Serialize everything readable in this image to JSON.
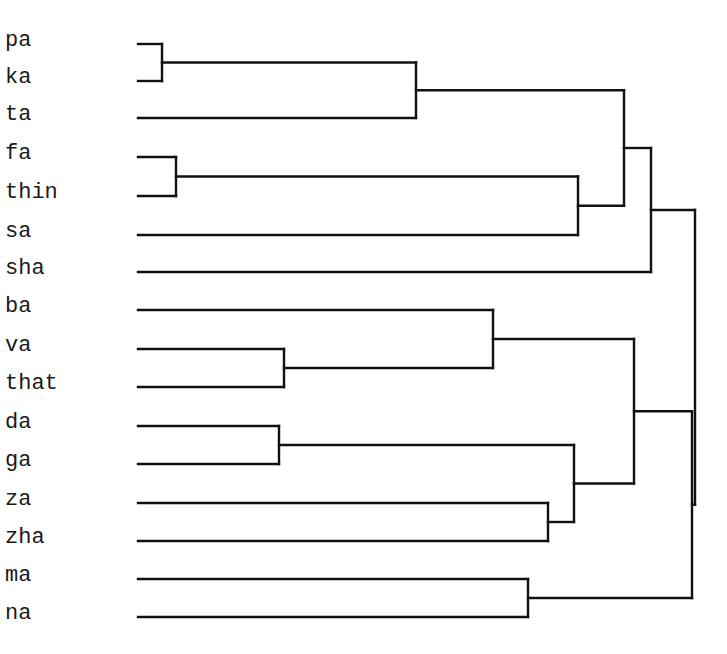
{
  "diagram": {
    "type": "dendrogram",
    "orientation": "horizontal",
    "line_color": "#111111",
    "line_width": 2.4,
    "leaf_line_start_x": 138,
    "leaves": [
      {
        "label": "pa",
        "y": 44
      },
      {
        "label": "ka",
        "y": 81
      },
      {
        "label": "ta",
        "y": 118
      },
      {
        "label": "fa",
        "y": 157
      },
      {
        "label": "thin",
        "y": 196
      },
      {
        "label": "sa",
        "y": 235
      },
      {
        "label": "sha",
        "y": 272
      },
      {
        "label": "ba",
        "y": 310
      },
      {
        "label": "va",
        "y": 349
      },
      {
        "label": "that",
        "y": 387
      },
      {
        "label": "da",
        "y": 426
      },
      {
        "label": "ga",
        "y": 464
      },
      {
        "label": "za",
        "y": 503
      },
      {
        "label": "zha",
        "y": 541
      },
      {
        "label": "ma",
        "y": 579
      },
      {
        "label": "na",
        "y": 617
      }
    ],
    "merges": [
      {
        "id": "n1",
        "children": [
          "pa",
          "ka"
        ],
        "x": 162
      },
      {
        "id": "n2",
        "children": [
          "n1",
          "ta"
        ],
        "x": 416
      },
      {
        "id": "n3",
        "children": [
          "fa",
          "thin"
        ],
        "x": 176
      },
      {
        "id": "n4",
        "children": [
          "n3",
          "sa"
        ],
        "x": 578
      },
      {
        "id": "n5",
        "children": [
          "n2",
          "n4"
        ],
        "x": 624
      },
      {
        "id": "n6",
        "children": [
          "n5",
          "sha"
        ],
        "x": 651
      },
      {
        "id": "n7",
        "children": [
          "va",
          "that"
        ],
        "x": 284
      },
      {
        "id": "n8",
        "children": [
          "ba",
          "n7"
        ],
        "x": 493
      },
      {
        "id": "n9",
        "children": [
          "da",
          "ga"
        ],
        "x": 279
      },
      {
        "id": "n10",
        "children": [
          "za",
          "zha"
        ],
        "x": 548
      },
      {
        "id": "n11",
        "children": [
          "n9",
          "n10"
        ],
        "x": 574
      },
      {
        "id": "n12",
        "children": [
          "n8",
          "n11"
        ],
        "x": 634
      },
      {
        "id": "n13",
        "children": [
          "ma",
          "na"
        ],
        "x": 528
      },
      {
        "id": "n14",
        "children": [
          "n12",
          "n13"
        ],
        "x": 692
      },
      {
        "id": "n15",
        "children": [
          "n6",
          "n14"
        ],
        "x": 695
      }
    ]
  }
}
